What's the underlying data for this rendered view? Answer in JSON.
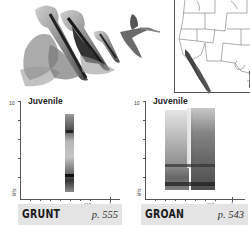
{
  "illustration": {
    "subject": "brown pelicans",
    "icon": "pelican-flock-illustration"
  },
  "range_map": {
    "icon": "range-map-western-north-america"
  },
  "spectrograms": [
    {
      "age_label": "Juvenile",
      "y_max": "10",
      "y_unit": "kHz",
      "x_unit": "sec",
      "x_tick": "1",
      "call_name": "GRUNT",
      "page_ref": "p. 555"
    },
    {
      "age_label": "Juvenile",
      "y_max": "10",
      "y_unit": "kHz",
      "x_unit": "sec",
      "x_tick": "1",
      "call_name": "GROAN",
      "page_ref": "p. 543"
    }
  ],
  "colors": {
    "label_bar": "#e4e4e4",
    "ink": "#1c1c1c"
  }
}
